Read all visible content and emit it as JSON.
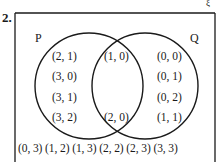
{
  "question_number": "2.",
  "universal_symbol": "ξ",
  "sets": {
    "P": {
      "label": "P"
    },
    "Q": {
      "label": "Q"
    }
  },
  "regions": {
    "p_only": [
      "(2, 1)",
      "(3, 0)",
      "(3, 1)",
      "(3, 2)"
    ],
    "intersection": [
      "(1, 0)",
      "(2, 0)"
    ],
    "q_only": [
      "(0, 0)",
      "(0, 1)",
      "(0, 2)",
      "(1, 1)"
    ],
    "outside": "(0, 3) (1, 2) (1, 3) (2, 2) (2, 3) (3, 3)"
  },
  "colors": {
    "line": "#1a1a1a",
    "background": "#ffffff"
  }
}
